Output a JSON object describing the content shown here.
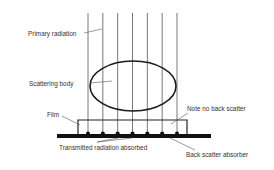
{
  "diagram": {
    "labels": {
      "primary_radiation": "Primary radiation",
      "scattering_body": "Scattering body",
      "film": "Film",
      "note_no_back_scatter": "Note no back scatter",
      "transmitted_radiation_absorbed": "Transmitted radiation absorbed",
      "back_scatter_absorber": "Back scatter absorber"
    },
    "beam_count": 7,
    "colors": {
      "line": "#555555",
      "ellipse": "#1a1a1a",
      "absorber": "#111111",
      "text": "#333333"
    }
  }
}
